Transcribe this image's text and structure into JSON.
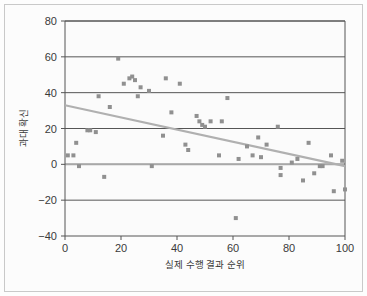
{
  "figure": {
    "background_color": "#fcfcfc",
    "border_color": "#c9c9c9",
    "plot_background_color": "#fbfbfb"
  },
  "chart_data": {
    "type": "scatter",
    "title": "",
    "xlabel": "실제 수행 결과 순위",
    "ylabel": "과대 확신",
    "xlim": [
      0,
      100
    ],
    "ylim": [
      -40,
      80
    ],
    "xticks": [
      0,
      20,
      40,
      60,
      80,
      100
    ],
    "yticks": [
      -40,
      -20,
      0,
      20,
      40,
      60,
      80
    ],
    "xtick_labels": [
      "0",
      "20",
      "40",
      "60",
      "80",
      "100"
    ],
    "ytick_labels": [
      "-40",
      "-20",
      "0",
      "20",
      "40",
      "60",
      "80"
    ],
    "grid": "horizontal",
    "grid_color": "#555555",
    "legend": "none",
    "marker": {
      "shape": "square",
      "color": "#909090",
      "size": 4
    },
    "points": [
      [
        1,
        5
      ],
      [
        3,
        5
      ],
      [
        4,
        12
      ],
      [
        5,
        -1
      ],
      [
        8,
        19
      ],
      [
        9,
        19
      ],
      [
        11,
        18
      ],
      [
        12,
        38
      ],
      [
        14,
        -7
      ],
      [
        16,
        32
      ],
      [
        19,
        59
      ],
      [
        21,
        45
      ],
      [
        23,
        48
      ],
      [
        24,
        49
      ],
      [
        25,
        47
      ],
      [
        26,
        38
      ],
      [
        27,
        43
      ],
      [
        30,
        41
      ],
      [
        31,
        -1
      ],
      [
        35,
        16
      ],
      [
        36,
        48
      ],
      [
        38,
        29
      ],
      [
        41,
        45
      ],
      [
        43,
        11
      ],
      [
        44,
        8
      ],
      [
        47,
        27
      ],
      [
        48,
        24
      ],
      [
        49,
        22
      ],
      [
        50,
        21
      ],
      [
        52,
        24
      ],
      [
        55,
        5
      ],
      [
        56,
        24
      ],
      [
        58,
        37
      ],
      [
        61,
        -30
      ],
      [
        62,
        3
      ],
      [
        65,
        10
      ],
      [
        67,
        5
      ],
      [
        69,
        15
      ],
      [
        70,
        4
      ],
      [
        72,
        11
      ],
      [
        76,
        21
      ],
      [
        77,
        -2
      ],
      [
        77,
        -6
      ],
      [
        81,
        1
      ],
      [
        83,
        3
      ],
      [
        85,
        -9
      ],
      [
        87,
        12
      ],
      [
        89,
        -5
      ],
      [
        91,
        -1
      ],
      [
        92,
        -1
      ],
      [
        95,
        5
      ],
      [
        96,
        -15
      ],
      [
        99,
        2
      ],
      [
        100,
        -14
      ]
    ],
    "trendline": {
      "type": "linear",
      "color": "#b0b0b0",
      "x_start": 0,
      "y_start": 33,
      "x_end": 100,
      "y_end": -1
    },
    "zero_line": {
      "color": "#a8a8a8",
      "y": 0
    }
  }
}
